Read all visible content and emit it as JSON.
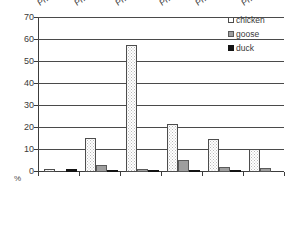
{
  "chart_data": {
    "type": "bar",
    "title": "",
    "xlabel": "",
    "ylabel": "%",
    "ylim": [
      0,
      70
    ],
    "ytick_step": 10,
    "grid": true,
    "legend_position": "top-right",
    "categories": [
      "Phase 2",
      "Phases 2-4",
      "Phases 5-7",
      "Phase 8",
      "Phases 9-10",
      "Phase 11"
    ],
    "series": [
      {
        "name": "chicken",
        "color": "#ffffff",
        "pattern": "dotted",
        "values": [
          1.5,
          15.5,
          57.5,
          21.8,
          15.0,
          10.3
        ]
      },
      {
        "name": "goose",
        "color": "#9e9e9e",
        "pattern": "solid-gray",
        "values": [
          0.0,
          3.0,
          1.4,
          5.3,
          2.4,
          1.7
        ]
      },
      {
        "name": "duck",
        "color": "#141414",
        "pattern": "solid-black",
        "values": [
          1.3,
          0.3,
          0.3,
          0.8,
          0.4,
          0.0
        ]
      }
    ],
    "ytick_labels": [
      "0",
      "10",
      "20",
      "30",
      "40",
      "50",
      "60",
      "70"
    ]
  },
  "axis": {
    "y_unit_label": "%",
    "y_ticks": [
      "70",
      "60",
      "50",
      "40",
      "30",
      "20",
      "10",
      "0"
    ]
  },
  "legend": {
    "items": [
      {
        "label": "chicken"
      },
      {
        "label": "goose"
      },
      {
        "label": "duck"
      }
    ]
  }
}
